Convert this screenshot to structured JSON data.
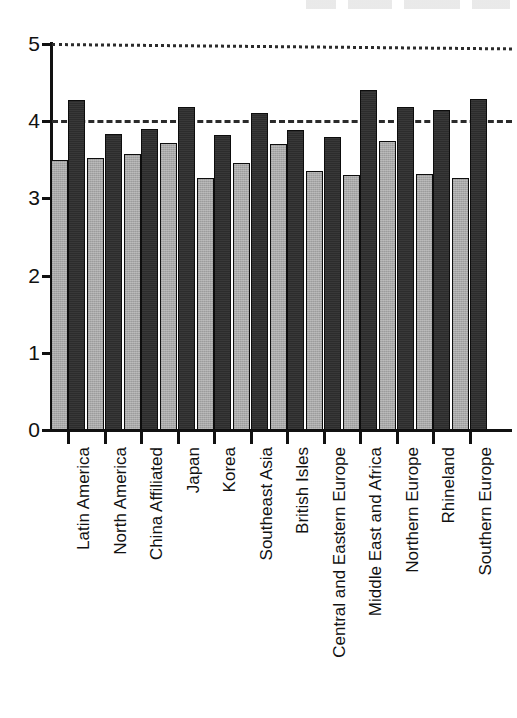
{
  "chart_data": {
    "type": "bar",
    "title": "",
    "subtitle": "",
    "xlabel": "",
    "ylabel": "",
    "ylim": [
      0,
      5
    ],
    "yticks": [
      0,
      1,
      2,
      3,
      4,
      5
    ],
    "ytick_labels": [
      "0",
      "1",
      "2",
      "3",
      "4",
      "5"
    ],
    "grid": false,
    "legend": null,
    "orientation": "vertical",
    "grouped": true,
    "bar_colors": {
      "light": "#A8A8A8",
      "dark": "#2C2C2C",
      "outline": "#0D0D0D"
    },
    "reference_lines": [
      {
        "name": "upper-reference-line",
        "value": 5,
        "style": "dotted",
        "color": "#2B2B2B"
      },
      {
        "name": "mid-reference-line",
        "value": 4,
        "style": "dashed",
        "color": "#2B2B2B"
      }
    ],
    "categories": [
      "Latin America",
      "North America",
      "China Affiliated",
      "Japan",
      "Korea",
      "Southeast Asia",
      "British Isles",
      "Central and Eastern Europe",
      "Middle East and Africa",
      "Northern Europe",
      "Rhineland",
      "Southern Europe"
    ],
    "series": [
      {
        "name": "light-series",
        "color": "#A8A8A8",
        "values": [
          3.5,
          3.52,
          3.57,
          3.72,
          3.27,
          3.46,
          3.7,
          3.35,
          3.3,
          3.75,
          3.32,
          3.27
        ]
      },
      {
        "name": "dark-series",
        "color": "#2C2C2C",
        "values": [
          4.27,
          3.84,
          3.9,
          4.18,
          3.82,
          4.11,
          3.88,
          3.79,
          4.4,
          4.18,
          4.15,
          4.29
        ]
      }
    ]
  }
}
